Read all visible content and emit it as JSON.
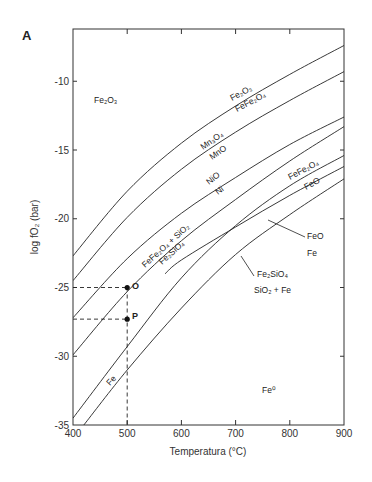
{
  "panel_label": "A",
  "chart_data": {
    "type": "line",
    "title": "",
    "xlabel": "Temperatura (°C)",
    "ylabel": "log fO2 (bar)",
    "xlim": [
      400,
      900
    ],
    "ylim": [
      -35,
      -6.2
    ],
    "xticks": [
      400,
      500,
      600,
      700,
      800,
      900
    ],
    "yticks": [
      -10,
      -15,
      -20,
      -25,
      -30,
      -35
    ],
    "grid": false,
    "series": [
      {
        "name": "Fe2O3 / FeFe2O4 (HM)",
        "x": [
          400,
          500,
          600,
          700,
          800,
          900
        ],
        "y": [
          -22.7,
          -18.0,
          -14.5,
          -11.8,
          -9.5,
          -7.4
        ]
      },
      {
        "name": "Mn3O4 / MnO",
        "x": [
          400,
          500,
          600,
          700,
          800,
          900
        ],
        "y": [
          -24.5,
          -19.9,
          -16.4,
          -13.7,
          -11.4,
          -9.3
        ]
      },
      {
        "name": "NiO / Ni (NNO)",
        "x": [
          400,
          500,
          600,
          700,
          800,
          900
        ],
        "y": [
          -27.2,
          -22.9,
          -19.6,
          -17.0,
          -14.6,
          -12.6
        ]
      },
      {
        "name": "FeFe2O4 + SiO2 / Fe2SiO4 (FMQ)",
        "x": [
          400,
          500,
          600,
          700,
          800,
          900
        ],
        "y": [
          -29.9,
          -25.3,
          -21.6,
          -18.6,
          -15.8,
          -13.3
        ]
      },
      {
        "name": "FeFe2O4 / FeO (MW)",
        "x": [
          400,
          500,
          600,
          700,
          800,
          900
        ],
        "y": [
          -34.5,
          -29.3,
          -24.3,
          -20.5,
          -17.6,
          -15.4
        ]
      },
      {
        "name": "FeO / Fe (WI)",
        "x": [
          570,
          600,
          700,
          800,
          900
        ],
        "y": [
          -24.0,
          -23.0,
          -20.6,
          -18.3,
          -16.2
        ]
      },
      {
        "name": "Fe2SiO4 / SiO2 + Fe (QIF)",
        "x": [
          420,
          500,
          600,
          700,
          800,
          900
        ],
        "y": [
          -35.0,
          -31.0,
          -26.5,
          -22.6,
          -19.7,
          -17.1
        ]
      }
    ],
    "points": [
      {
        "name": "O",
        "x": 500,
        "y": -25.0
      },
      {
        "name": "P",
        "x": 500,
        "y": -27.3
      }
    ],
    "annotations": [
      {
        "text": "Fe2O3",
        "region": "upper-left"
      },
      {
        "text": "Fe2O3 / FeFe2O4",
        "curve": 0
      },
      {
        "text": "Mn3O4 / MnO",
        "curve": 1
      },
      {
        "text": "NiO / Ni",
        "curve": 2
      },
      {
        "text": "FeFe2O4 + SiO2 / Fe2SiO4",
        "curve": 3
      },
      {
        "text": "FeFe2O4 / FeO",
        "curve": 4
      },
      {
        "text": "FeO / Fe",
        "curve": 5
      },
      {
        "text": "Fe2SiO4 / SiO2 + Fe",
        "curve": 6
      },
      {
        "text": "Fe",
        "curve": 4
      },
      {
        "text": "Fe°",
        "region": "lower-right"
      }
    ]
  },
  "labels": {
    "fe2o3_region": "Fe₂O₃",
    "fe2o3": "Fe₂O₃",
    "fefe2o4_a": "FeFe₂O₄",
    "mn3o4": "Mn₃O₄",
    "mno": "MnO",
    "nio": "NiO",
    "ni": "Ni",
    "fmq_top": "FeFe₂O₄ + SiO₂",
    "fmq_bottom": "Fe₂SiO₄",
    "fefe2o4_b": "FeFe₂O₄",
    "feo_b": "FeO",
    "feo_leader": "FeO",
    "fe_leader": "Fe",
    "fe2sio4_leader": "Fe₂SiO₄",
    "sio2fe_leader": "SiO₂ + Fe",
    "fe_curve": "Fe",
    "fe0_region": "Fe⁰",
    "point_o": "O",
    "point_p": "P"
  },
  "axes": {
    "xlabel": "Temperatura (°C)",
    "ylabel": "log fO₂ (bar)",
    "xtick_labels": [
      "400",
      "500",
      "600",
      "700",
      "800",
      "900"
    ],
    "ytick_labels": [
      "-10",
      "-15",
      "-20",
      "-25",
      "-30",
      "-35"
    ]
  }
}
